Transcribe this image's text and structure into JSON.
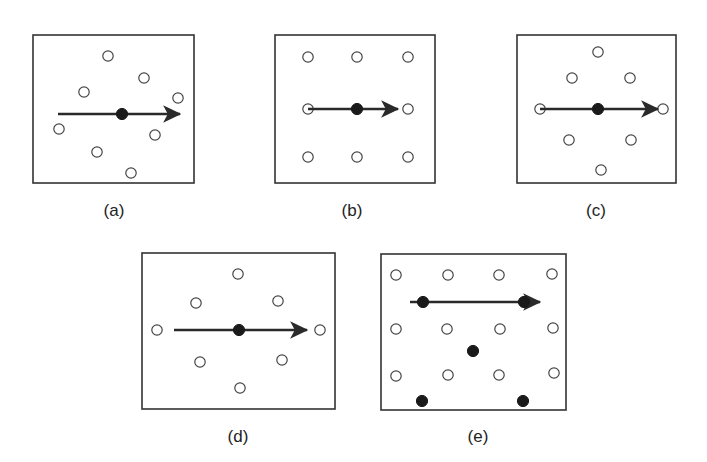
{
  "figure": {
    "colors": {
      "frame": "#333333",
      "open_dot": "#444444",
      "filled_dot": "#1a1a1a",
      "arrow": "#2a2a2a"
    },
    "panels": [
      {
        "id": "a",
        "label": "(a)",
        "frame": {
          "x": 33,
          "y": 35,
          "w": 161,
          "h": 148
        },
        "label_pos": {
          "x": 114,
          "y": 216
        },
        "open_dots": [
          [
            108,
            56
          ],
          [
            144,
            78
          ],
          [
            84,
            92
          ],
          [
            178,
            98
          ],
          [
            59,
            129
          ],
          [
            155,
            135
          ],
          [
            97,
            152
          ],
          [
            131,
            173
          ]
        ],
        "filled_dots": [
          [
            122,
            114
          ]
        ],
        "arrow": {
          "x1": 58,
          "y1": 114,
          "x2": 186,
          "y2": 114
        }
      },
      {
        "id": "b",
        "label": "(b)",
        "frame": {
          "x": 275,
          "y": 35,
          "w": 160,
          "h": 148
        },
        "label_pos": {
          "x": 352,
          "y": 216
        },
        "open_dots": [
          [
            308,
            57
          ],
          [
            357,
            57
          ],
          [
            408,
            57
          ],
          [
            308,
            109
          ],
          [
            408,
            109
          ],
          [
            308,
            157
          ],
          [
            357,
            157
          ],
          [
            408,
            157
          ]
        ],
        "filled_dots": [
          [
            357,
            109
          ]
        ],
        "arrow": {
          "x1": 308,
          "y1": 109,
          "x2": 404,
          "y2": 109
        }
      },
      {
        "id": "c",
        "label": "(c)",
        "frame": {
          "x": 517,
          "y": 35,
          "w": 159,
          "h": 148
        },
        "label_pos": {
          "x": 596,
          "y": 216
        },
        "open_dots": [
          [
            598,
            52
          ],
          [
            572,
            78
          ],
          [
            630,
            78
          ],
          [
            540,
            109
          ],
          [
            663,
            109
          ],
          [
            569,
            140
          ],
          [
            631,
            140
          ],
          [
            601,
            170
          ]
        ],
        "filled_dots": [
          [
            598,
            109
          ]
        ],
        "arrow": {
          "x1": 540,
          "y1": 109,
          "x2": 664,
          "y2": 109
        }
      },
      {
        "id": "d",
        "label": "(d)",
        "frame": {
          "x": 142,
          "y": 253,
          "w": 193,
          "h": 156
        },
        "label_pos": {
          "x": 238,
          "y": 442
        },
        "open_dots": [
          [
            238,
            274
          ],
          [
            196,
            303
          ],
          [
            278,
            301
          ],
          [
            157,
            330
          ],
          [
            320,
            330
          ],
          [
            200,
            362
          ],
          [
            282,
            360
          ],
          [
            240,
            388
          ]
        ],
        "filled_dots": [
          [
            239,
            330
          ]
        ],
        "arrow": {
          "x1": 174,
          "y1": 330,
          "x2": 313,
          "y2": 330
        }
      },
      {
        "id": "e",
        "label": "(e)",
        "frame": {
          "x": 381,
          "y": 254,
          "w": 185,
          "h": 156
        },
        "label_pos": {
          "x": 478,
          "y": 442
        },
        "open_dots": [
          [
            396,
            275
          ],
          [
            448,
            275
          ],
          [
            499,
            275
          ],
          [
            552,
            274
          ],
          [
            396,
            329
          ],
          [
            447,
            329
          ],
          [
            500,
            329
          ],
          [
            553,
            328
          ],
          [
            396,
            376
          ],
          [
            448,
            375
          ],
          [
            499,
            375
          ],
          [
            554,
            373
          ]
        ],
        "filled_dots": [
          [
            423,
            302
          ],
          [
            524,
            302
          ],
          [
            473,
            351
          ],
          [
            422,
            401
          ],
          [
            523,
            401
          ]
        ],
        "arrow": {
          "x1": 410,
          "y1": 302,
          "x2": 546,
          "y2": 302
        }
      }
    ]
  }
}
